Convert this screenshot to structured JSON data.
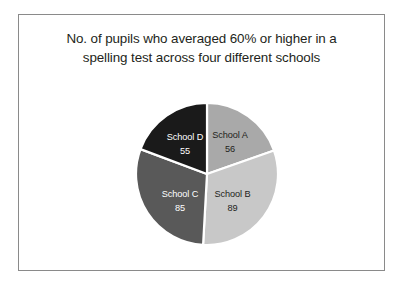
{
  "chart_data": {
    "type": "pie",
    "title": "No. of pupils who averaged 60% or higher in a\nspelling test across four different schools",
    "xlabel": "",
    "ylabel": "",
    "legend": "none",
    "grid": false,
    "total": 285,
    "categories": [
      "School A",
      "School B",
      "School C",
      "School D"
    ],
    "values": [
      56,
      89,
      85,
      55
    ],
    "slices": [
      {
        "label": "School A",
        "value": 56,
        "value_text": "56",
        "color": "#a9a9a9",
        "text_color": "#231f20",
        "start_angle": 0,
        "sweep_angle": 70.74,
        "label_x": 95.0,
        "label_y": 36.0,
        "value_x": 95.0,
        "value_y": 49.5
      },
      {
        "label": "School B",
        "value": 89,
        "value_text": "89",
        "color": "#c8c8c8",
        "text_color": "#231f20",
        "start_angle": 70.74,
        "sweep_angle": 112.42,
        "label_x": 97.5,
        "label_y": 95.0,
        "value_x": 97.5,
        "value_y": 108.5
      },
      {
        "label": "School C",
        "value": 85,
        "value_text": "85",
        "color": "#595959",
        "text_color": "#ffffff",
        "start_angle": 183.16,
        "sweep_angle": 107.37,
        "label_x": 45.0,
        "label_y": 95.0,
        "value_x": 45.0,
        "value_y": 108.5
      },
      {
        "label": "School D",
        "value": 55,
        "value_text": "55",
        "color": "#1a1a1a",
        "text_color": "#ffffff",
        "start_angle": 290.53,
        "sweep_angle": 69.47,
        "label_x": 50.0,
        "label_y": 38.0,
        "value_x": 50.0,
        "value_y": 51.5
      }
    ],
    "separator_color": "#ffffff",
    "frame_border_color": "#8a8a8a",
    "background_color": "#ffffff"
  }
}
